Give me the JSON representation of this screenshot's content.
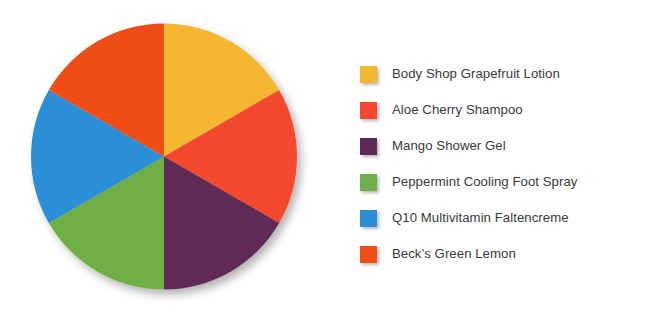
{
  "chart_data": {
    "type": "pie",
    "title": "",
    "subtitle": "",
    "xlabel": "",
    "ylabel": "",
    "grid": false,
    "legend_position": "right",
    "start_angle_deg": 0,
    "direction": "clockwise",
    "categories": [
      "Body Shop Grapefruit Lotion",
      "Aloe Cherry Shampoo",
      "Mango Shower Gel",
      "Peppermint Cooling Foot Spray",
      "Q10 Multivitamin Faltencreme",
      "Beck’s Green Lemon"
    ],
    "values": [
      1,
      1,
      1,
      1,
      1,
      1
    ],
    "percentages": [
      16.67,
      16.67,
      16.67,
      16.67,
      16.67,
      16.67
    ],
    "slice_angles_deg": [
      60,
      60,
      60,
      60,
      60,
      60
    ],
    "colors": [
      "#F5B731",
      "#F4492F",
      "#5E2A55",
      "#6FAF45",
      "#2B8FD6",
      "#F04E14"
    ],
    "slices": [
      {
        "label": "Body Shop Grapefruit Lotion",
        "value": 1,
        "percent": 16.67,
        "color": "#F5B731",
        "start_deg": 0,
        "end_deg": 60
      },
      {
        "label": "Aloe Cherry Shampoo",
        "value": 1,
        "percent": 16.67,
        "color": "#F4492F",
        "start_deg": 60,
        "end_deg": 120
      },
      {
        "label": "Mango Shower Gel",
        "value": 1,
        "percent": 16.67,
        "color": "#5E2A55",
        "start_deg": 120,
        "end_deg": 180
      },
      {
        "label": "Peppermint Cooling Foot Spray",
        "value": 1,
        "percent": 16.67,
        "color": "#6FAF45",
        "start_deg": 180,
        "end_deg": 240
      },
      {
        "label": "Q10 Multivitamin Faltencreme",
        "value": 1,
        "percent": 16.67,
        "color": "#2B8FD6",
        "start_deg": 240,
        "end_deg": 300
      },
      {
        "label": "Beck’s Green Lemon",
        "value": 1,
        "percent": 16.67,
        "color": "#F04E14",
        "start_deg": 300,
        "end_deg": 360
      }
    ]
  },
  "legend": {
    "items": [
      {
        "label": "Body Shop Grapefruit Lotion",
        "color": "#F5B731"
      },
      {
        "label": "Aloe Cherry Shampoo",
        "color": "#F4492F"
      },
      {
        "label": "Mango Shower Gel",
        "color": "#5E2A55"
      },
      {
        "label": "Peppermint Cooling Foot Spray",
        "color": "#6FAF45"
      },
      {
        "label": "Q10 Multivitamin Faltencreme",
        "color": "#2B8FD6"
      },
      {
        "label": "Beck’s Green Lemon",
        "color": "#F04E14"
      }
    ]
  },
  "style": {
    "background": "#FFFFFF",
    "text_color": "#3A3A3A"
  }
}
